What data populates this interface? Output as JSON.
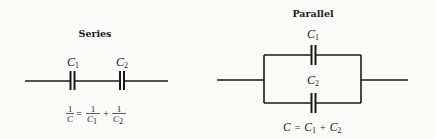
{
  "series": {
    "title": "Series",
    "cap1": {
      "letter": "C",
      "sub": "1"
    },
    "cap2": {
      "letter": "C",
      "sub": "2"
    },
    "formula": {
      "lhs_num": "1",
      "lhs_den": "C",
      "equals": "=",
      "t1_num": "1",
      "t1_den": "C",
      "t1_sub": "1",
      "plus": "+",
      "t2_num": "1",
      "t2_den": "C",
      "t2_sub": "2"
    }
  },
  "parallel": {
    "title": "Parallel",
    "cap1": {
      "letter": "C",
      "sub": "1"
    },
    "cap2": {
      "letter": "C",
      "sub": "2"
    },
    "formula": {
      "lhs": "C",
      "equals": "=",
      "t1": "C",
      "t1_sub": "1",
      "plus": "+",
      "t2": "C",
      "t2_sub": "2"
    }
  },
  "colors": {
    "ink": "#1a1a1a",
    "background": "#fbfbf9"
  }
}
